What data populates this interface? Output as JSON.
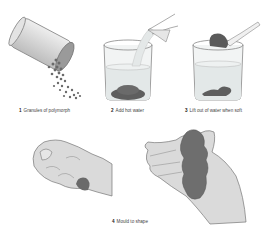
{
  "diagram": {
    "steps": [
      {
        "number": "1",
        "label": "Granules of polymorph"
      },
      {
        "number": "2",
        "label": "Add hot water"
      },
      {
        "number": "3",
        "label": "Lift out of water when soft"
      },
      {
        "number": "4",
        "label": "Mould to shape"
      }
    ]
  },
  "colors": {
    "background": "#ffffff",
    "outline": "#7a7a7a",
    "container_fill": "#dcdcdc",
    "granule": "#6a6a6a",
    "water": "#e6eaea",
    "skin": "#d8d8d8",
    "polymorph_mass": "#707070",
    "caption_text": "#444444"
  }
}
